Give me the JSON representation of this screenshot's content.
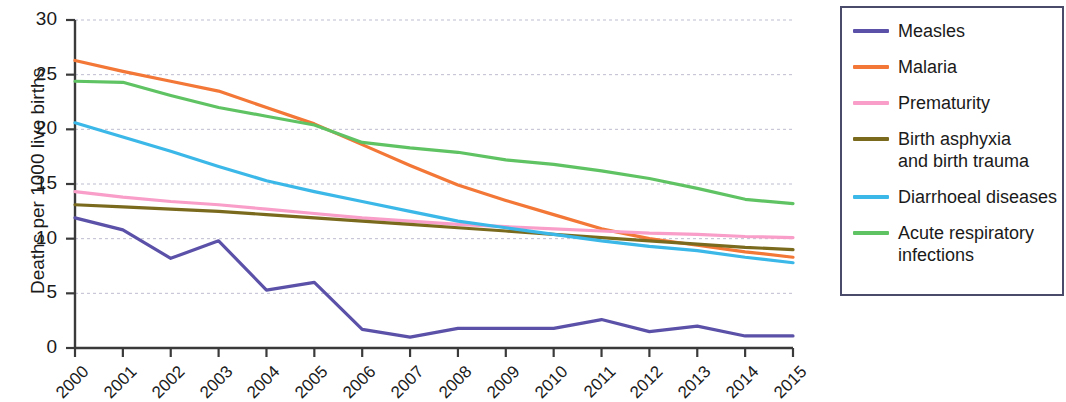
{
  "chart_data": {
    "type": "line",
    "title": "",
    "xlabel": "",
    "ylabel": "Deaths per 1000 live births",
    "xlim": [
      2000,
      2015
    ],
    "ylim": [
      0,
      30
    ],
    "ytick_values": [
      0,
      5,
      10,
      15,
      20,
      25,
      30
    ],
    "ytick_labels": [
      "0",
      "5",
      "10",
      "15",
      "20",
      "25",
      "30"
    ],
    "grid": "horizontal-dashed",
    "legend_position": "right-outside-box",
    "categories": [
      "2000",
      "2001",
      "2002",
      "2003",
      "2004",
      "2005",
      "2006",
      "2007",
      "2008",
      "2009",
      "2010",
      "2011",
      "2012",
      "2013",
      "2014",
      "2015"
    ],
    "x": [
      2000,
      2001,
      2002,
      2003,
      2004,
      2005,
      2006,
      2007,
      2008,
      2009,
      2010,
      2011,
      2012,
      2013,
      2014,
      2015
    ],
    "series": [
      {
        "name": "Measles",
        "color": "#5b51a8",
        "values": [
          11.9,
          10.8,
          8.2,
          9.8,
          5.3,
          6.0,
          1.7,
          1.0,
          1.8,
          1.8,
          1.8,
          2.6,
          1.5,
          2.0,
          1.1,
          1.1
        ]
      },
      {
        "name": "Malaria",
        "color": "#f37736",
        "values": [
          26.3,
          25.3,
          24.4,
          23.5,
          22.0,
          20.5,
          18.6,
          16.7,
          14.9,
          13.5,
          12.2,
          10.9,
          10.0,
          9.4,
          8.8,
          8.3
        ]
      },
      {
        "name": "Prematurity",
        "color": "#f99ec8",
        "values": [
          14.3,
          13.8,
          13.4,
          13.1,
          12.7,
          12.3,
          11.9,
          11.6,
          11.3,
          11.1,
          10.9,
          10.7,
          10.5,
          10.4,
          10.2,
          10.1
        ]
      },
      {
        "name": "Birth asphyxia\nand birth trauma",
        "color": "#7a6a1e",
        "values": [
          13.1,
          12.9,
          12.7,
          12.5,
          12.2,
          11.9,
          11.6,
          11.3,
          11.0,
          10.7,
          10.4,
          10.1,
          9.8,
          9.5,
          9.2,
          9.0
        ]
      },
      {
        "name": "Diarrhoeal diseases",
        "color": "#3bb8e8",
        "values": [
          20.6,
          19.3,
          18.0,
          16.6,
          15.3,
          14.3,
          13.4,
          12.5,
          11.6,
          11.0,
          10.4,
          9.8,
          9.3,
          8.9,
          8.3,
          7.8
        ]
      },
      {
        "name": "Acute respiratory\ninfections",
        "color": "#5fc363",
        "values": [
          24.4,
          24.3,
          23.1,
          22.0,
          21.2,
          20.4,
          18.8,
          18.3,
          17.9,
          17.2,
          16.8,
          16.2,
          15.5,
          14.6,
          13.6,
          13.2
        ]
      }
    ]
  },
  "legend": {
    "items": [
      {
        "label": "Measles",
        "color": "#5b51a8"
      },
      {
        "label": "Malaria",
        "color": "#f37736"
      },
      {
        "label": "Prematurity",
        "color": "#f99ec8"
      },
      {
        "label": "Birth asphyxia\nand birth trauma",
        "color": "#7a6a1e"
      },
      {
        "label": "Diarrhoeal diseases",
        "color": "#3bb8e8"
      },
      {
        "label": "Acute respiratory\ninfections",
        "color": "#5fc363"
      }
    ]
  },
  "axis": {
    "y_title": "Deaths per 1000 live births"
  },
  "colors": {
    "axis": "#3a3a3a",
    "grid": "#bdbdd0",
    "legend_border": "#4a4a6a",
    "text": "#1a1a1a"
  }
}
